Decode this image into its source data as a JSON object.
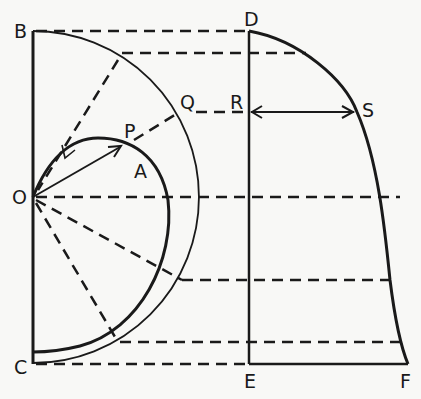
{
  "diagram": {
    "colors": {
      "ink": "#1a1a1a",
      "background": "#f8f8f6"
    },
    "labels": {
      "B": "B",
      "O": "O",
      "C": "C",
      "P": "P",
      "A": "A",
      "Q": "Q",
      "R": "R",
      "S": "S",
      "D": "D",
      "E": "E",
      "F": "F"
    }
  }
}
